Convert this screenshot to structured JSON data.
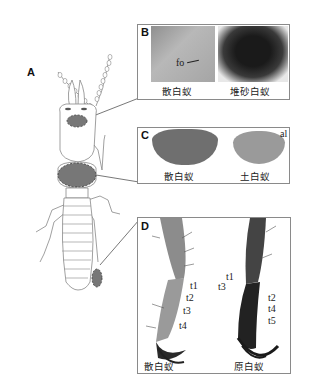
{
  "figure": {
    "panel_A": {
      "label": "A"
    },
    "panel_B": {
      "label": "B",
      "annotation": "fo",
      "captions": [
        "散白蚁",
        "堆砂白蚁"
      ]
    },
    "panel_C": {
      "label": "C",
      "annotation": "al",
      "captions": [
        "散白蚁",
        "土白蚁"
      ]
    },
    "panel_D": {
      "label": "D",
      "left_annotations": [
        "t1",
        "t2",
        "t3",
        "t4"
      ],
      "right_annotations": [
        "t1",
        "t3",
        "t2",
        "t4",
        "t5"
      ],
      "captions": [
        "散白蚁",
        "原白蚁"
      ]
    }
  }
}
